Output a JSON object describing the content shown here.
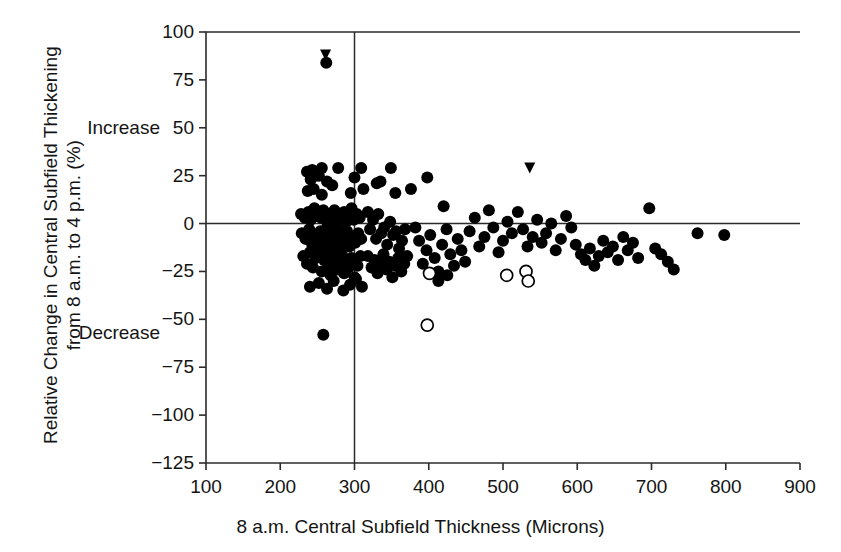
{
  "figure": {
    "title_clipped": "",
    "background": "#ffffff",
    "ink": "#141414"
  },
  "axes": {
    "x": {
      "label": "8 a.m. Central Subfield Thickness (Microns)",
      "ticks": [
        100,
        200,
        300,
        400,
        500,
        600,
        700,
        800,
        900
      ],
      "tick_labels": [
        "100",
        "200",
        "300",
        "400",
        "500",
        "600",
        "700",
        "800",
        "900"
      ],
      "lim": [
        100,
        900
      ]
    },
    "y": {
      "label_line1": "Relative Change in Central Subfield Thickening",
      "label_line2": "from 8 a.m. to 4 p.m. (%)",
      "ticks": [
        100,
        75,
        50,
        25,
        0,
        -25,
        -50,
        -75,
        -100,
        -125
      ],
      "tick_labels": [
        "100",
        "75",
        "50",
        "25",
        "0",
        "−25",
        "−50",
        "−75",
        "−100",
        "−125"
      ],
      "lim": [
        -125,
        100
      ]
    },
    "annotations": [
      {
        "name": "increase-label",
        "text": "Increase",
        "x_value": 100,
        "y_value": 50
      },
      {
        "name": "decrease-label",
        "text": "Decrease",
        "x_value": 100,
        "y_value": -57
      }
    ],
    "reference_lines": [
      {
        "name": "zero-change-line",
        "orientation": "horizontal",
        "y_value": 0
      },
      {
        "name": "threshold-thickness-line",
        "orientation": "vertical",
        "x_value": 300
      }
    ]
  },
  "chart_data": {
    "type": "scatter",
    "title": "",
    "xlabel": "8 a.m. Central Subfield Thickness (Microns)",
    "ylabel": "Relative Change in Central Subfield Thickening from 8 a.m. to 4 p.m. (%)",
    "xlim": [
      100,
      900
    ],
    "ylim": [
      -125,
      100
    ],
    "xticks": [
      100,
      200,
      300,
      400,
      500,
      600,
      700,
      800,
      900
    ],
    "yticks": [
      100,
      75,
      50,
      25,
      0,
      -25,
      -50,
      -75,
      -100,
      -125
    ],
    "grid": false,
    "legend": false,
    "hlines": [
      0
    ],
    "vlines": [
      300
    ],
    "series": [
      {
        "name": "filled-circle",
        "marker": "filled-circle",
        "color": "#000000",
        "radius_px": 6,
        "points": [
          [
            262,
            84
          ],
          [
            236,
            27
          ],
          [
            243,
            28
          ],
          [
            241,
            23
          ],
          [
            247,
            25
          ],
          [
            252,
            25
          ],
          [
            237,
            17
          ],
          [
            245,
            18
          ],
          [
            256,
            15
          ],
          [
            263,
            22
          ],
          [
            270,
            20
          ],
          [
            256,
            29
          ],
          [
            278,
            29
          ],
          [
            300,
            24
          ],
          [
            295,
            16
          ],
          [
            309,
            29
          ],
          [
            335,
            22
          ],
          [
            312,
            18
          ],
          [
            228,
            5
          ],
          [
            233,
            3
          ],
          [
            238,
            6
          ],
          [
            241,
            2
          ],
          [
            246,
            8
          ],
          [
            249,
            4
          ],
          [
            252,
            6
          ],
          [
            255,
            3
          ],
          [
            258,
            7
          ],
          [
            261,
            2
          ],
          [
            264,
            5
          ],
          [
            267,
            1
          ],
          [
            270,
            4
          ],
          [
            273,
            7
          ],
          [
            276,
            2
          ],
          [
            279,
            5
          ],
          [
            283,
            3
          ],
          [
            286,
            6
          ],
          [
            289,
            1
          ],
          [
            292,
            4
          ],
          [
            296,
            8
          ],
          [
            299,
            2
          ],
          [
            303,
            5
          ],
          [
            307,
            3
          ],
          [
            229,
            -5
          ],
          [
            234,
            -8
          ],
          [
            239,
            -3
          ],
          [
            243,
            -11
          ],
          [
            247,
            -6
          ],
          [
            251,
            -9
          ],
          [
            254,
            -4
          ],
          [
            257,
            -12
          ],
          [
            260,
            -7
          ],
          [
            263,
            -2
          ],
          [
            266,
            -10
          ],
          [
            269,
            -5
          ],
          [
            272,
            -13
          ],
          [
            275,
            -8
          ],
          [
            278,
            -3
          ],
          [
            281,
            -11
          ],
          [
            284,
            -6
          ],
          [
            287,
            -9
          ],
          [
            290,
            -4
          ],
          [
            293,
            -12
          ],
          [
            297,
            -7
          ],
          [
            301,
            -10
          ],
          [
            305,
            -5
          ],
          [
            309,
            -8
          ],
          [
            231,
            -17
          ],
          [
            236,
            -21
          ],
          [
            240,
            -15
          ],
          [
            244,
            -23
          ],
          [
            248,
            -18
          ],
          [
            252,
            -14
          ],
          [
            256,
            -25
          ],
          [
            259,
            -19
          ],
          [
            262,
            -16
          ],
          [
            265,
            -22
          ],
          [
            268,
            -27
          ],
          [
            271,
            -20
          ],
          [
            274,
            -17
          ],
          [
            277,
            -24
          ],
          [
            280,
            -21
          ],
          [
            283,
            -16
          ],
          [
            286,
            -26
          ],
          [
            289,
            -19
          ],
          [
            292,
            -23
          ],
          [
            296,
            -18
          ],
          [
            300,
            -28
          ],
          [
            304,
            -22
          ],
          [
            308,
            -17
          ],
          [
            240,
            -33
          ],
          [
            252,
            -31
          ],
          [
            263,
            -34
          ],
          [
            272,
            -30
          ],
          [
            285,
            -35
          ],
          [
            294,
            -32
          ],
          [
            302,
            -29
          ],
          [
            310,
            -33
          ],
          [
            258,
            -58
          ],
          [
            318,
            6
          ],
          [
            321,
            -3
          ],
          [
            325,
            2
          ],
          [
            329,
            -8
          ],
          [
            332,
            5
          ],
          [
            336,
            -5
          ],
          [
            340,
            -2
          ],
          [
            344,
            -11
          ],
          [
            348,
            1
          ],
          [
            352,
            -6
          ],
          [
            356,
            -4
          ],
          [
            360,
            -13
          ],
          [
            364,
            -9
          ],
          [
            368,
            -3
          ],
          [
            318,
            -17
          ],
          [
            323,
            -23
          ],
          [
            327,
            -19
          ],
          [
            331,
            -26
          ],
          [
            335,
            -21
          ],
          [
            339,
            -16
          ],
          [
            343,
            -24
          ],
          [
            347,
            -20
          ],
          [
            351,
            -28
          ],
          [
            355,
            -22
          ],
          [
            359,
            -18
          ],
          [
            363,
            -25
          ],
          [
            367,
            -21
          ],
          [
            371,
            -17
          ],
          [
            330,
            21
          ],
          [
            349,
            29
          ],
          [
            355,
            16
          ],
          [
            376,
            18
          ],
          [
            382,
            -2
          ],
          [
            387,
            -9
          ],
          [
            392,
            -21
          ],
          [
            397,
            -14
          ],
          [
            402,
            -6
          ],
          [
            408,
            -18
          ],
          [
            413,
            -25
          ],
          [
            418,
            -11
          ],
          [
            424,
            -3
          ],
          [
            429,
            -16
          ],
          [
            434,
            -22
          ],
          [
            439,
            -8
          ],
          [
            444,
            -14
          ],
          [
            449,
            -20
          ],
          [
            413,
            -30
          ],
          [
            425,
            -27
          ],
          [
            398,
            24
          ],
          [
            420,
            9
          ],
          [
            455,
            -4
          ],
          [
            462,
            3
          ],
          [
            468,
            -12
          ],
          [
            475,
            -7
          ],
          [
            481,
            7
          ],
          [
            487,
            -2
          ],
          [
            494,
            -15
          ],
          [
            500,
            -9
          ],
          [
            506,
            1
          ],
          [
            512,
            -5
          ],
          [
            520,
            6
          ],
          [
            527,
            -3
          ],
          [
            533,
            -12
          ],
          [
            540,
            -7
          ],
          [
            546,
            2
          ],
          [
            552,
            -10
          ],
          [
            558,
            -5
          ],
          [
            565,
            0
          ],
          [
            571,
            -14
          ],
          [
            578,
            -8
          ],
          [
            585,
            4
          ],
          [
            592,
            -2
          ],
          [
            598,
            -11
          ],
          [
            605,
            -16
          ],
          [
            611,
            -19
          ],
          [
            617,
            -13
          ],
          [
            623,
            -22
          ],
          [
            629,
            -17
          ],
          [
            635,
            -9
          ],
          [
            641,
            -15
          ],
          [
            648,
            -12
          ],
          [
            655,
            -19
          ],
          [
            662,
            -7
          ],
          [
            668,
            -14
          ],
          [
            675,
            -10
          ],
          [
            682,
            -18
          ],
          [
            697,
            8
          ],
          [
            705,
            -13
          ],
          [
            713,
            -16
          ],
          [
            722,
            -20
          ],
          [
            730,
            -24
          ],
          [
            762,
            -5
          ],
          [
            798,
            -6
          ]
        ]
      },
      {
        "name": "open-circle",
        "marker": "open-circle",
        "color": "#000000",
        "radius_px": 6,
        "points": [
          [
            401,
            -26
          ],
          [
            398,
            -53
          ],
          [
            505,
            -27
          ],
          [
            531,
            -25
          ],
          [
            534,
            -30
          ]
        ]
      },
      {
        "name": "down-triangle",
        "marker": "down-triangle",
        "color": "#000000",
        "size_px": 11,
        "points": [
          [
            261,
            88
          ],
          [
            536,
            29
          ]
        ]
      }
    ]
  },
  "geometry": {
    "plot_left_px": 206,
    "plot_right_px": 800,
    "plot_top_px": 32,
    "plot_bottom_px": 463
  }
}
